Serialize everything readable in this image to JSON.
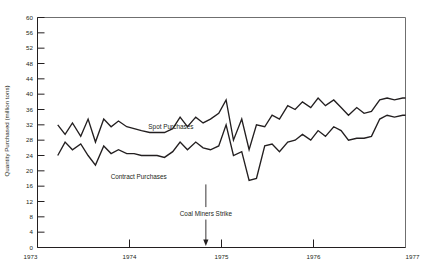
{
  "chart_data": {
    "type": "line",
    "title": "",
    "xlabel": "",
    "ylabel": "Quantity Purchased (million tons)",
    "xlim": [
      1973.0,
      1977.0
    ],
    "ylim": [
      0,
      60
    ],
    "y_ticks": [
      0,
      4,
      8,
      12,
      16,
      20,
      24,
      28,
      32,
      36,
      40,
      44,
      48,
      52,
      56,
      60
    ],
    "x_ticks": [
      1973,
      1974,
      1975,
      1976,
      1977
    ],
    "x_tick_labels": [
      "1973",
      "1974",
      "1975",
      "1976",
      "1977"
    ],
    "grid": false,
    "legend": "inline-labels",
    "annotations": [
      {
        "text": "Coal Miners Strike",
        "x": 1974.83,
        "y": 0,
        "arrow": true,
        "label_y": 8.2
      }
    ],
    "series": [
      {
        "name": "Spot Purchases",
        "label_x": 1974.45,
        "label_y": 30.8,
        "x": [
          1973.22,
          1973.3,
          1973.38,
          1973.47,
          1973.55,
          1973.63,
          1973.72,
          1973.8,
          1973.88,
          1973.97,
          1974.05,
          1974.13,
          1974.22,
          1974.3,
          1974.38,
          1974.47,
          1974.55,
          1974.63,
          1974.72,
          1974.8,
          1974.88,
          1974.97,
          1975.05,
          1975.13,
          1975.22,
          1975.3,
          1975.38,
          1975.47,
          1975.55,
          1975.63,
          1975.72,
          1975.8,
          1975.88,
          1975.97,
          1976.05,
          1976.13,
          1976.22,
          1976.3,
          1976.38,
          1976.47,
          1976.55,
          1976.63,
          1976.72,
          1976.8,
          1976.88,
          1976.97,
          1977.0
        ],
        "values": [
          32.0,
          29.5,
          32.5,
          29.0,
          33.5,
          27.5,
          33.5,
          31.5,
          33.0,
          31.5,
          31.0,
          30.5,
          30.0,
          30.0,
          30.0,
          31.0,
          34.0,
          31.5,
          34.0,
          32.5,
          33.5,
          35.0,
          38.5,
          28.0,
          33.5,
          25.5,
          32.0,
          31.5,
          34.5,
          33.5,
          37.0,
          36.0,
          38.0,
          36.5,
          39.0,
          37.0,
          38.5,
          36.5,
          34.5,
          36.5,
          35.0,
          35.5,
          38.5,
          39.0,
          38.5,
          39.0,
          39.0
        ]
      },
      {
        "name": "Contract Purchases",
        "label_x": 1974.1,
        "label_y": 17.8,
        "x": [
          1973.22,
          1973.3,
          1973.38,
          1973.47,
          1973.55,
          1973.63,
          1973.72,
          1973.8,
          1973.88,
          1973.97,
          1974.05,
          1974.13,
          1974.22,
          1974.3,
          1974.38,
          1974.47,
          1974.55,
          1974.63,
          1974.72,
          1974.8,
          1974.88,
          1974.97,
          1975.05,
          1975.13,
          1975.22,
          1975.3,
          1975.38,
          1975.47,
          1975.55,
          1975.63,
          1975.72,
          1975.8,
          1975.88,
          1975.97,
          1976.05,
          1976.13,
          1976.22,
          1976.3,
          1976.38,
          1976.47,
          1976.55,
          1976.63,
          1976.72,
          1976.8,
          1976.88,
          1976.97,
          1977.0
        ],
        "values": [
          24.0,
          27.5,
          25.5,
          27.0,
          24.0,
          21.5,
          26.5,
          24.5,
          25.5,
          24.5,
          24.5,
          24.0,
          24.0,
          24.0,
          23.5,
          25.0,
          27.5,
          25.5,
          27.5,
          26.0,
          25.5,
          26.5,
          32.0,
          24.0,
          25.0,
          17.5,
          18.0,
          26.5,
          27.0,
          25.0,
          27.5,
          28.0,
          29.5,
          28.0,
          30.5,
          29.0,
          31.5,
          30.5,
          28.0,
          28.5,
          28.5,
          29.0,
          33.5,
          34.5,
          34.0,
          34.5,
          34.5
        ]
      }
    ]
  },
  "figure": {
    "background_color": "#ffffff",
    "line_color": "#231f20",
    "frame_color": "#6f6f6f"
  }
}
